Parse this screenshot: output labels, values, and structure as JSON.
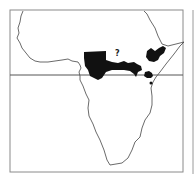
{
  "map": {
    "title": "",
    "region": "Africa",
    "style": "black-and-white outline",
    "reference_line": "equator",
    "annotation": "?",
    "colors": {
      "background": "#ffffff",
      "frame": "#8a8a8a",
      "coastline": "#444444",
      "range": "#111111"
    },
    "range_areas": [
      {
        "name": "central-african-range"
      },
      {
        "name": "ethiopian-highlands-range"
      },
      {
        "name": "lake-victoria-range"
      },
      {
        "name": "east-african-spot"
      }
    ]
  }
}
